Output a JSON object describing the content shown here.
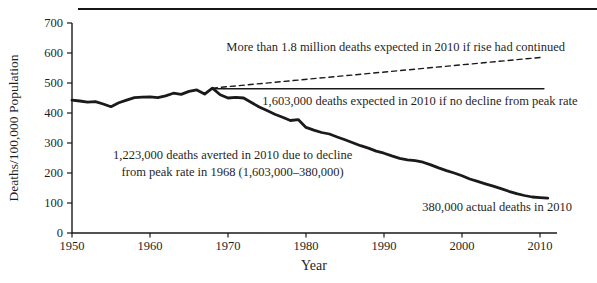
{
  "figure": {
    "background": "#ffffff",
    "line_color": "#1a1a1a",
    "text_color": "#1f1f1f"
  },
  "chart_data": {
    "type": "line",
    "title": "",
    "xlabel": "Year",
    "ylabel": "Deaths/100,000 Population",
    "xlim": [
      1950,
      2010
    ],
    "ylim": [
      0,
      700
    ],
    "x_ticks": [
      1950,
      1960,
      1970,
      1980,
      1990,
      2000,
      2010
    ],
    "y_ticks": [
      0,
      100,
      200,
      300,
      400,
      500,
      600,
      700
    ],
    "grid": false,
    "legend_position": "none",
    "series": [
      {
        "name": "actual-death-rate",
        "style": "solid",
        "width": 2.8,
        "points": [
          [
            1950,
            443
          ],
          [
            1951,
            440
          ],
          [
            1952,
            436
          ],
          [
            1953,
            438
          ],
          [
            1954,
            430
          ],
          [
            1955,
            421
          ],
          [
            1956,
            434
          ],
          [
            1957,
            443
          ],
          [
            1958,
            451
          ],
          [
            1959,
            453
          ],
          [
            1960,
            454
          ],
          [
            1961,
            451
          ],
          [
            1962,
            457
          ],
          [
            1963,
            466
          ],
          [
            1964,
            462
          ],
          [
            1965,
            472
          ],
          [
            1966,
            477
          ],
          [
            1967,
            463
          ],
          [
            1968,
            483
          ],
          [
            1969,
            461
          ],
          [
            1970,
            450
          ],
          [
            1971,
            452
          ],
          [
            1972,
            450
          ],
          [
            1973,
            435
          ],
          [
            1974,
            420
          ],
          [
            1975,
            408
          ],
          [
            1976,
            396
          ],
          [
            1977,
            386
          ],
          [
            1978,
            375
          ],
          [
            1979,
            378
          ],
          [
            1980,
            352
          ],
          [
            1981,
            343
          ],
          [
            1982,
            335
          ],
          [
            1983,
            330
          ],
          [
            1984,
            320
          ],
          [
            1985,
            311
          ],
          [
            1986,
            301
          ],
          [
            1987,
            291
          ],
          [
            1988,
            283
          ],
          [
            1989,
            273
          ],
          [
            1990,
            266
          ],
          [
            1991,
            257
          ],
          [
            1992,
            249
          ],
          [
            1993,
            244
          ],
          [
            1994,
            241
          ],
          [
            1995,
            236
          ],
          [
            1996,
            227
          ],
          [
            1997,
            217
          ],
          [
            1998,
            208
          ],
          [
            1999,
            200
          ],
          [
            2000,
            191
          ],
          [
            2001,
            180
          ],
          [
            2002,
            172
          ],
          [
            2003,
            164
          ],
          [
            2004,
            156
          ],
          [
            2005,
            148
          ],
          [
            2006,
            139
          ],
          [
            2007,
            131
          ],
          [
            2008,
            125
          ],
          [
            2009,
            120
          ],
          [
            2010,
            118
          ],
          [
            2011,
            116
          ]
        ]
      },
      {
        "name": "no-decline-from-peak-rate",
        "style": "solid",
        "width": 1.5,
        "points": [
          [
            1968,
            481
          ],
          [
            2010.5,
            481
          ]
        ]
      },
      {
        "name": "continued-rise-projection",
        "style": "dashed",
        "width": 1.4,
        "points": [
          [
            1968,
            483
          ],
          [
            2010,
            585
          ]
        ]
      }
    ],
    "annotations": [
      {
        "id": "rise-continued",
        "x": 1991.5,
        "y": 617,
        "lines": [
          "More than 1.8 million deaths expected in 2010 if rise had continued"
        ]
      },
      {
        "id": "no-decline",
        "x": 1994.6,
        "y": 437,
        "lines": [
          "1,603,000 deaths expected in 2010 if no decline from peak rate"
        ]
      },
      {
        "id": "deaths-averted",
        "x": 1970.6,
        "y": 230,
        "lines": [
          "1,223,000 deaths averted in 2010 due to decline",
          "from peak rate in 1968 (1,603,000–380,000)"
        ]
      },
      {
        "id": "actual-deaths",
        "x": 2004.5,
        "y": 83,
        "lines": [
          "380,000 actual deaths in 2010"
        ]
      }
    ]
  }
}
